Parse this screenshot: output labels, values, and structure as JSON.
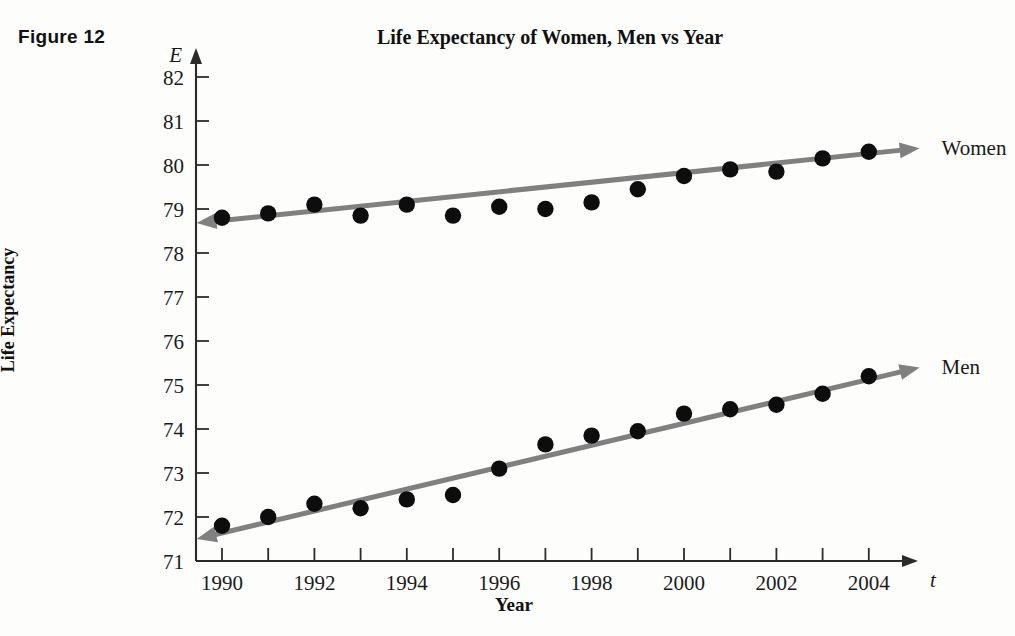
{
  "figure": {
    "caption": "Figure 12"
  },
  "chart_data": {
    "type": "scatter",
    "title": "Life Expectancy of Women, Men vs Year",
    "xlabel": "Year",
    "ylabel": "Life Expectancy",
    "x_axis_symbol": "t",
    "y_axis_symbol": "E",
    "grid": false,
    "legend_position": "right-inline",
    "xlim": [
      1989.3,
      2005.2
    ],
    "ylim": [
      71,
      82.4
    ],
    "x_tick_interval": 1,
    "x_label_interval": 2,
    "y_tick_interval": 1,
    "x_tick_labels": [
      "1990",
      "1992",
      "1994",
      "1996",
      "1998",
      "2000",
      "2002",
      "2004"
    ],
    "x_tick_values": [
      1990,
      1992,
      1994,
      1996,
      1998,
      2000,
      2002,
      2004
    ],
    "y_tick_labels": [
      "71",
      "72",
      "73",
      "74",
      "75",
      "76",
      "77",
      "78",
      "79",
      "80",
      "81",
      "82"
    ],
    "y_tick_values": [
      71,
      72,
      73,
      74,
      75,
      76,
      77,
      78,
      79,
      80,
      81,
      82
    ],
    "x": [
      1990,
      1991,
      1992,
      1993,
      1994,
      1995,
      1996,
      1997,
      1998,
      1999,
      2000,
      2001,
      2002,
      2003,
      2004
    ],
    "series": [
      {
        "name": "Women",
        "label": "Women",
        "marker": "filled-circle",
        "color": "#0d0d0d",
        "values": [
          78.8,
          78.9,
          79.1,
          78.85,
          79.1,
          78.85,
          79.05,
          79.0,
          79.15,
          79.45,
          79.75,
          79.9,
          79.85,
          80.15,
          80.3
        ],
        "trend": {
          "color": "#808080",
          "x_start": 1989.45,
          "y_start": 78.68,
          "x_end": 2005.1,
          "y_end": 80.38,
          "arrow_start": true,
          "arrow_end": true
        }
      },
      {
        "name": "Men",
        "label": "Men",
        "marker": "filled-circle",
        "color": "#0d0d0d",
        "values": [
          71.8,
          72.0,
          72.3,
          72.2,
          72.4,
          72.5,
          73.1,
          73.65,
          73.85,
          73.95,
          74.35,
          74.45,
          74.55,
          74.8,
          75.2
        ],
        "trend": {
          "color": "#808080",
          "x_start": 1989.45,
          "y_start": 71.5,
          "x_end": 2005.1,
          "y_end": 75.4,
          "arrow_start": true,
          "arrow_end": true
        }
      }
    ]
  }
}
